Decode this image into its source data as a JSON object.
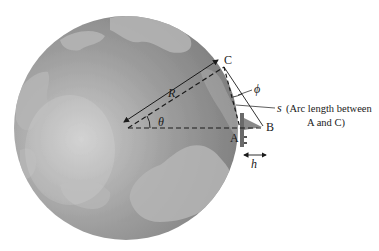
{
  "figure": {
    "colors": {
      "ocean": "#8e8e8e",
      "ocean_highlight": "#c4c4c4",
      "land": "#b3b3b3",
      "lines": "#1a1a1a",
      "background": "#ffffff"
    },
    "labels": {
      "point_c": "C",
      "point_a": "A",
      "point_b": "B",
      "radius": "R",
      "theta": "θ",
      "phi": "ϕ",
      "arc": "s",
      "arc_note_line1": "(Arc length between",
      "arc_note_line2": "A and C)",
      "height": "h"
    },
    "geometry": {
      "globe_center": [
        126,
        128
      ],
      "globe_radius": 112,
      "point_C": [
        222,
        60
      ],
      "point_A": [
        240,
        128
      ],
      "point_B": [
        264,
        127
      ]
    }
  }
}
